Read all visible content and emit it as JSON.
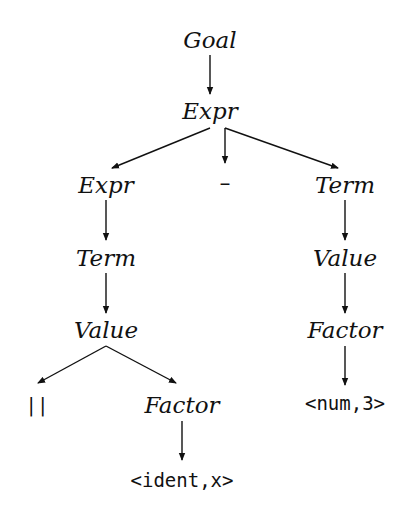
{
  "diagram": {
    "type": "parse-tree",
    "nodes": [
      {
        "id": "goal",
        "label": "Goal",
        "kind": "nonterminal",
        "x": 210,
        "y": 40
      },
      {
        "id": "expr_root",
        "label": "Expr",
        "kind": "nonterminal",
        "x": 210,
        "y": 111
      },
      {
        "id": "expr_left",
        "label": "Expr",
        "kind": "nonterminal",
        "x": 106,
        "y": 185
      },
      {
        "id": "minus",
        "label": "–",
        "kind": "terminal",
        "x": 225,
        "y": 183
      },
      {
        "id": "term_right",
        "label": "Term",
        "kind": "nonterminal",
        "x": 345,
        "y": 185
      },
      {
        "id": "term_left",
        "label": "Term",
        "kind": "nonterminal",
        "x": 106,
        "y": 258
      },
      {
        "id": "value_right",
        "label": "Value",
        "kind": "nonterminal",
        "x": 345,
        "y": 258
      },
      {
        "id": "value_left",
        "label": "Value",
        "kind": "nonterminal",
        "x": 106,
        "y": 330
      },
      {
        "id": "factor_right",
        "label": "Factor",
        "kind": "nonterminal",
        "x": 345,
        "y": 330
      },
      {
        "id": "bars",
        "label": "||",
        "kind": "terminal",
        "x": 37,
        "y": 405
      },
      {
        "id": "factor_left",
        "label": "Factor",
        "kind": "nonterminal",
        "x": 182,
        "y": 405
      },
      {
        "id": "num3",
        "label": "<num,3>",
        "kind": "terminal",
        "x": 345,
        "y": 403
      },
      {
        "id": "ident_x",
        "label": "<ident,x>",
        "kind": "terminal",
        "x": 182,
        "y": 480
      }
    ],
    "edges": [
      {
        "from": "goal",
        "to": "expr_root",
        "x1": 210,
        "y1": 55,
        "x2": 210,
        "y2": 94
      },
      {
        "from": "expr_root",
        "to": "expr_left",
        "x1": 210,
        "y1": 128,
        "x2": 112,
        "y2": 168
      },
      {
        "from": "expr_root",
        "to": "minus",
        "x1": 225,
        "y1": 128,
        "x2": 225,
        "y2": 163
      },
      {
        "from": "expr_root",
        "to": "term_right",
        "x1": 225,
        "y1": 128,
        "x2": 338,
        "y2": 168
      },
      {
        "from": "expr_left",
        "to": "term_left",
        "x1": 106,
        "y1": 200,
        "x2": 106,
        "y2": 240
      },
      {
        "from": "term_right",
        "to": "value_right",
        "x1": 345,
        "y1": 200,
        "x2": 345,
        "y2": 240
      },
      {
        "from": "term_left",
        "to": "value_left",
        "x1": 106,
        "y1": 273,
        "x2": 106,
        "y2": 313
      },
      {
        "from": "value_right",
        "to": "factor_right",
        "x1": 345,
        "y1": 273,
        "x2": 345,
        "y2": 313
      },
      {
        "from": "value_left",
        "to": "bars",
        "x1": 106,
        "y1": 346,
        "x2": 38,
        "y2": 383
      },
      {
        "from": "value_left",
        "to": "factor_left",
        "x1": 106,
        "y1": 346,
        "x2": 176,
        "y2": 383
      },
      {
        "from": "factor_right",
        "to": "num3",
        "x1": 345,
        "y1": 346,
        "x2": 345,
        "y2": 385
      },
      {
        "from": "factor_left",
        "to": "ident_x",
        "x1": 182,
        "y1": 421,
        "x2": 182,
        "y2": 460
      }
    ],
    "colors": {
      "stroke": "#111111",
      "text": "#111111",
      "background": "#ffffff"
    }
  }
}
